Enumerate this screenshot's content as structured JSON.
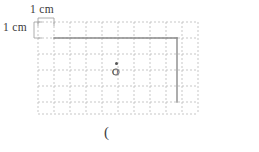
{
  "figure": {
    "type": "geometry-grid-diagram",
    "background_color": "#ffffff",
    "grid": {
      "style": "dashed",
      "color": "#b9b9b9",
      "cell_size_px": 16,
      "columns": 10,
      "rows": 5,
      "origin_x_px": 38,
      "origin_y_px": 22,
      "width_px": 160,
      "height_px": 80
    },
    "scale_labels": {
      "top": "1 cm",
      "left": "1 cm",
      "unit": "cm",
      "value": 1
    },
    "shape": {
      "name": "rectangle",
      "stroke_color": "#8a8a8a",
      "drawn_edges": [
        "top",
        "right"
      ],
      "top_edge": {
        "x1": 54,
        "y1": 38,
        "x2": 177,
        "y2": 38
      },
      "right_edge": {
        "x1": 177,
        "y1": 38,
        "x2": 177,
        "y2": 102
      },
      "width_cells": 7.7,
      "height_cells": 4
    },
    "point": {
      "label": "O",
      "marker": "dot",
      "x_px": 116,
      "y_px": 63,
      "color": "#555555"
    },
    "caption": "("
  }
}
